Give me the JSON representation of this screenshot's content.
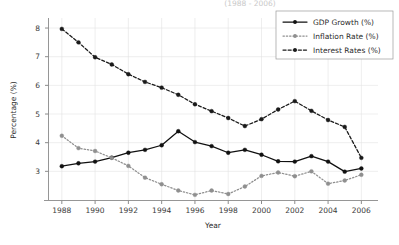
{
  "figure": {
    "title_partial": "(1988 - 2006)",
    "background": "#ffffff"
  },
  "chart_data": {
    "type": "line",
    "title": "(1988 - 2006)",
    "xlabel": "Year",
    "ylabel": "Percentage (%)",
    "x": [
      1988,
      1989,
      1990,
      1991,
      1992,
      1993,
      1994,
      1995,
      1996,
      1997,
      1998,
      1999,
      2000,
      2001,
      2002,
      2003,
      2004,
      2005,
      2006
    ],
    "xticks": [
      1988,
      1990,
      1992,
      1994,
      1996,
      1998,
      2000,
      2002,
      2004,
      2006
    ],
    "xtick_labels": [
      "1988",
      "1990",
      "1992",
      "1994",
      "1996",
      "1998",
      "2000",
      "2002",
      "2004",
      "2006"
    ],
    "yticks": [
      3,
      4,
      5,
      6,
      7,
      8
    ],
    "ytick_labels": [
      "3",
      "4",
      "5",
      "6",
      "7",
      "8"
    ],
    "xlim": [
      1987.2,
      2007.0
    ],
    "ylim": [
      2.0,
      8.35
    ],
    "grid": true,
    "legend_position": "upper right",
    "series": [
      {
        "name": "GDP Growth (%)",
        "color": "#111111",
        "linestyle": "solid",
        "marker": "circle",
        "values": [
          3.18,
          3.28,
          3.34,
          3.48,
          3.65,
          3.75,
          3.91,
          4.4,
          4.02,
          3.88,
          3.65,
          3.75,
          3.58,
          3.35,
          3.34,
          3.53,
          3.34,
          2.99,
          3.1
        ]
      },
      {
        "name": "Inflation Rate (%)",
        "color": "#8f8f8f",
        "linestyle": "dotted",
        "marker": "circle",
        "values": [
          4.24,
          3.81,
          3.71,
          3.47,
          3.19,
          2.78,
          2.55,
          2.33,
          2.18,
          2.33,
          2.21,
          2.47,
          2.84,
          2.96,
          2.83,
          3.0,
          2.57,
          2.68,
          2.88
        ]
      },
      {
        "name": "Interest Rates (%)",
        "color": "#1a1a1a",
        "linestyle": "dashed",
        "marker": "circle",
        "values": [
          7.97,
          7.5,
          6.98,
          6.73,
          6.39,
          6.12,
          5.92,
          5.67,
          5.34,
          5.1,
          4.86,
          4.58,
          4.82,
          5.16,
          5.45,
          5.11,
          4.79,
          4.55,
          3.47
        ]
      }
    ]
  },
  "axes": {
    "ylabel": "Percentage (%)",
    "xlabel": "Year"
  },
  "legend": {
    "entries": [
      {
        "label": "GDP Growth (%)"
      },
      {
        "label": "Inflation Rate (%)"
      },
      {
        "label": "Interest Rates (%)"
      }
    ]
  }
}
